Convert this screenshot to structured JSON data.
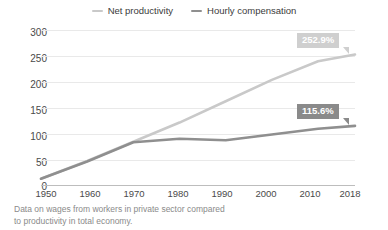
{
  "chart_data": {
    "type": "line",
    "title": "",
    "xlabel": "",
    "ylabel": "",
    "x": [
      1950,
      1960,
      1970,
      1980,
      1990,
      2000,
      2010,
      2018
    ],
    "xtick_labels": [
      "1950",
      "1960",
      "1970",
      "1980",
      "1990",
      "2000",
      "2010",
      "2018"
    ],
    "ytick_labels": [
      "0",
      "50",
      "100",
      "150",
      "200",
      "250",
      "300"
    ],
    "yticks": [
      0,
      50,
      100,
      150,
      200,
      250,
      300
    ],
    "ylim": [
      0,
      300
    ],
    "xlim": [
      1950,
      2018
    ],
    "grid": true,
    "legend_position": "top-center",
    "series": [
      {
        "name": "Net productivity",
        "color": "#c9c9c9",
        "values": [
          14,
          48,
          85,
          122,
          163,
          204,
          240,
          252.9
        ],
        "end_label": "252.9%"
      },
      {
        "name": "Hourly compensation",
        "color": "#8f8f8f",
        "values": [
          14,
          47,
          84,
          91,
          88,
          99,
          110,
          115.6
        ],
        "end_label": "115.6%"
      }
    ],
    "annotations": [
      {
        "text": "252.9%",
        "series": "Net productivity",
        "x": 2018,
        "background": "#cfcfcf"
      },
      {
        "text": "115.6%",
        "series": "Hourly compensation",
        "x": 2018,
        "background": "#8a8a8a"
      }
    ],
    "caption": "Data on wages from workers in private sector compared to productivity in total economy."
  },
  "legend": {
    "items": [
      {
        "label": "Net productivity",
        "color": "#c9c9c9"
      },
      {
        "label": "Hourly compensation",
        "color": "#8f8f8f"
      }
    ]
  },
  "yaxis": {
    "t6": "300",
    "t5": "250",
    "t4": "200",
    "t3": "150",
    "t2": "100",
    "t1": "50",
    "t0": "0"
  },
  "xaxis": {
    "t0": "1950",
    "t1": "1960",
    "t2": "1970",
    "t3": "1980",
    "t4": "1990",
    "t5": "2000",
    "t6": "2010",
    "t7": "2018"
  },
  "badges": {
    "productivity": "252.9%",
    "compensation": "115.6%"
  },
  "caption": {
    "line1": "Data on wages from workers in private sector compared",
    "line2": "to productivity in total economy."
  }
}
